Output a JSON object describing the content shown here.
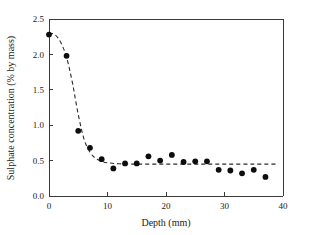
{
  "chart_data": {
    "type": "scatter",
    "title": "",
    "xlabel": "Depth (mm)",
    "ylabel": "Sulphate concentration (% by mass)",
    "xlim": [
      0,
      40
    ],
    "ylim": [
      0.0,
      2.5
    ],
    "xticks": [
      0,
      10,
      20,
      30,
      40
    ],
    "xtick_labels": [
      "0",
      "10",
      "20",
      "30",
      "40"
    ],
    "yticks": [
      0.0,
      0.5,
      1.0,
      1.5,
      2.0,
      2.5
    ],
    "ytick_labels": [
      "0.0",
      "0.5",
      "1.0",
      "1.5",
      "2.0",
      "2.5"
    ],
    "grid": false,
    "legend": null,
    "series": [
      {
        "name": "Measured sulphate concentration",
        "marker": "filled-circle",
        "color": "#0d0d0d",
        "x": [
          0,
          3,
          5,
          7,
          9,
          11,
          13,
          15,
          17,
          19,
          21,
          23,
          25,
          27,
          29,
          31,
          33,
          35,
          37
        ],
        "y": [
          2.28,
          1.98,
          0.92,
          0.68,
          0.52,
          0.39,
          0.46,
          0.46,
          0.56,
          0.5,
          0.58,
          0.48,
          0.49,
          0.49,
          0.37,
          0.36,
          0.32,
          0.37,
          0.27
        ]
      },
      {
        "name": "Fitted decay curve",
        "marker": "none",
        "style": "dashed",
        "color": "#2b2b2b",
        "x": [
          0,
          1,
          2,
          3,
          4,
          5,
          6,
          7,
          8,
          9,
          10,
          12,
          15,
          20,
          25,
          30,
          35,
          39
        ],
        "y": [
          2.3,
          2.28,
          2.17,
          1.96,
          1.6,
          1.15,
          0.8,
          0.62,
          0.53,
          0.49,
          0.47,
          0.455,
          0.45,
          0.45,
          0.45,
          0.45,
          0.45,
          0.45
        ]
      }
    ]
  },
  "axes": {
    "x_title": "Depth (mm)",
    "y_title": "Sulphate concentration (% by mass)"
  }
}
